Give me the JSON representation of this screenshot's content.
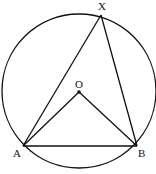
{
  "diagram": {
    "type": "geometry",
    "colors": {
      "stroke": "#111111",
      "background": "#ffffff"
    },
    "circle": {
      "center_label": "O",
      "cx": 79,
      "cy": 91,
      "r": 77
    },
    "points": {
      "O": {
        "label": "O",
        "x": 79,
        "y": 92
      },
      "A": {
        "label": "A",
        "x": 23,
        "y": 146
      },
      "B": {
        "label": "B",
        "x": 137,
        "y": 146
      },
      "X": {
        "label": "X",
        "x": 101,
        "y": 15
      }
    },
    "segments": [
      "AX",
      "XB",
      "AB",
      "AO",
      "OB"
    ]
  }
}
